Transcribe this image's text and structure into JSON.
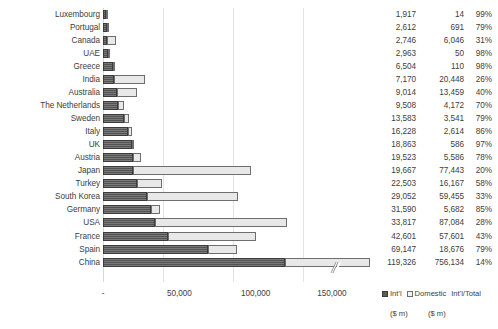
{
  "chart_data": {
    "type": "bar",
    "subtype": "stacked-horizontal",
    "title": "",
    "xlabel": "",
    "ylabel": "",
    "xlim": [
      0,
      175000
    ],
    "xticks": [
      "-",
      "50,000",
      "100,000",
      "150,000"
    ],
    "xtick_values": [
      0,
      50000,
      100000,
      150000
    ],
    "grid": true,
    "legend_position": "bottom-right",
    "axis_break": {
      "category": "China",
      "note": "broken axis on China bar"
    },
    "categories": [
      "Luxembourg",
      "Portugal",
      "Canada",
      "UAE",
      "Greece",
      "India",
      "Australia",
      "The Netherlands",
      "Sweden",
      "Italy",
      "UK",
      "Austria",
      "Japan",
      "Turkey",
      "South Korea",
      "Germany",
      "USA",
      "France",
      "Spain",
      "China"
    ],
    "series": [
      {
        "name": "Int'l",
        "unit": "$ m",
        "values": [
          1917,
          2612,
          2746,
          2963,
          6504,
          7170,
          9014,
          9508,
          13583,
          16228,
          18863,
          19523,
          19667,
          22503,
          29052,
          31590,
          33817,
          42601,
          69147,
          119326
        ]
      },
      {
        "name": "Domestic",
        "unit": "$ m",
        "values": [
          14,
          691,
          6046,
          50,
          110,
          20448,
          13459,
          4172,
          3541,
          2614,
          586,
          5586,
          77443,
          16167,
          59455,
          5682,
          87084,
          57601,
          18676,
          756134
        ]
      }
    ],
    "ratio": {
      "name": "Int'l/Total",
      "values": [
        "99%",
        "79%",
        "31%",
        "98%",
        "98%",
        "26%",
        "40%",
        "70%",
        "79%",
        "86%",
        "97%",
        "78%",
        "20%",
        "58%",
        "33%",
        "85%",
        "28%",
        "43%",
        "79%",
        "14%"
      ]
    },
    "colors": {
      "intl": "#5c5c5c",
      "domestic": "#e8e8e8",
      "grid": "#e4e4e4",
      "text": "#404040"
    }
  },
  "rows": [
    {
      "label": "Luxembourg",
      "intl": "1,917",
      "dom": "14",
      "pct": "99%"
    },
    {
      "label": "Portugal",
      "intl": "2,612",
      "dom": "691",
      "pct": "79%"
    },
    {
      "label": "Canada",
      "intl": "2,746",
      "dom": "6,046",
      "pct": "31%"
    },
    {
      "label": "UAE",
      "intl": "2,963",
      "dom": "50",
      "pct": "98%"
    },
    {
      "label": "Greece",
      "intl": "6,504",
      "dom": "110",
      "pct": "98%"
    },
    {
      "label": "India",
      "intl": "7,170",
      "dom": "20,448",
      "pct": "26%"
    },
    {
      "label": "Australia",
      "intl": "9,014",
      "dom": "13,459",
      "pct": "40%"
    },
    {
      "label": "The Netherlands",
      "intl": "9,508",
      "dom": "4,172",
      "pct": "70%"
    },
    {
      "label": "Sweden",
      "intl": "13,583",
      "dom": "3,541",
      "pct": "79%"
    },
    {
      "label": "Italy",
      "intl": "16,228",
      "dom": "2,614",
      "pct": "86%"
    },
    {
      "label": "UK",
      "intl": "18,863",
      "dom": "586",
      "pct": "97%"
    },
    {
      "label": "Austria",
      "intl": "19,523",
      "dom": "5,586",
      "pct": "78%"
    },
    {
      "label": "Japan",
      "intl": "19,667",
      "dom": "77,443",
      "pct": "20%"
    },
    {
      "label": "Turkey",
      "intl": "22,503",
      "dom": "16,167",
      "pct": "58%"
    },
    {
      "label": "South Korea",
      "intl": "29,052",
      "dom": "59,455",
      "pct": "33%"
    },
    {
      "label": "Germany",
      "intl": "31,590",
      "dom": "5,682",
      "pct": "85%"
    },
    {
      "label": "USA",
      "intl": "33,817",
      "dom": "87,084",
      "pct": "28%"
    },
    {
      "label": "France",
      "intl": "42,601",
      "dom": "57,601",
      "pct": "43%"
    },
    {
      "label": "Spain",
      "intl": "69,147",
      "dom": "18,676",
      "pct": "79%"
    },
    {
      "label": "China",
      "intl": "119,326",
      "dom": "756,134",
      "pct": "14%"
    }
  ],
  "xaxis": {
    "ticks": [
      "-",
      "50,000",
      "100,000",
      "150,000"
    ]
  },
  "legend": {
    "intl_label": "Int'l",
    "domestic_label": "Domestic",
    "ratio_label": "Int'l/Total",
    "intl_unit": "($ m)",
    "domestic_unit": "($ m)"
  }
}
